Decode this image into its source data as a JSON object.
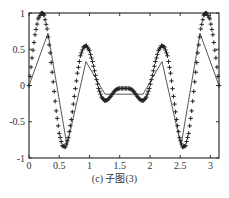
{
  "chart_data": {
    "type": "line",
    "title": "",
    "caption": "(c) 子图(3)",
    "xlabel": "",
    "ylabel": "",
    "xlim": [
      0,
      3.1416
    ],
    "ylim": [
      -1,
      1
    ],
    "xticks": [
      0,
      0.5,
      1,
      1.5,
      2,
      2.5,
      3
    ],
    "xtick_labels": [
      "0",
      "0.5",
      "1",
      "1.5",
      "2",
      "2.5",
      "3"
    ],
    "yticks": [
      -1,
      -0.5,
      0,
      0.5,
      1
    ],
    "ytick_labels": [
      "-1",
      "-0.5",
      "0",
      "0.5",
      "1"
    ],
    "grid": false,
    "legend": null,
    "series": [
      {
        "name": "dense samples (+ markers)",
        "style": "plus-markers",
        "color": "#222222",
        "function_hint": "symmetric about pi/2: max 1 at x~0.22, min ~-0.85 at x~0.6, max ~0.55 at x~0.95, min ~-0.2 at x~1.35, local max ~-0.05 at pi/2",
        "x": [
          0.0,
          0.05,
          0.1,
          0.15,
          0.2,
          0.22,
          0.25,
          0.3,
          0.35,
          0.4,
          0.45,
          0.5,
          0.55,
          0.6,
          0.65,
          0.7,
          0.75,
          0.8,
          0.85,
          0.9,
          0.95,
          1.0,
          1.05,
          1.1,
          1.15,
          1.2,
          1.25,
          1.3,
          1.35,
          1.4,
          1.45,
          1.5,
          1.5708,
          1.64,
          1.69,
          1.74,
          1.79,
          1.84,
          1.89,
          1.94,
          1.99,
          2.04,
          2.09,
          2.14,
          2.19,
          2.24,
          2.29,
          2.34,
          2.39,
          2.44,
          2.49,
          2.54,
          2.59,
          2.64,
          2.69,
          2.74,
          2.79,
          2.84,
          2.89,
          2.92,
          2.94,
          2.99,
          3.04,
          3.09,
          3.1416
        ],
        "y": [
          0.0,
          0.38,
          0.7,
          0.92,
          0.99,
          1.0,
          0.97,
          0.78,
          0.45,
          0.05,
          -0.35,
          -0.66,
          -0.83,
          -0.85,
          -0.72,
          -0.47,
          -0.15,
          0.17,
          0.41,
          0.53,
          0.55,
          0.48,
          0.33,
          0.14,
          -0.04,
          -0.16,
          -0.21,
          -0.2,
          -0.15,
          -0.09,
          -0.05,
          -0.04,
          -0.04,
          -0.04,
          -0.05,
          -0.09,
          -0.15,
          -0.2,
          -0.21,
          -0.16,
          -0.04,
          0.14,
          0.33,
          0.48,
          0.55,
          0.53,
          0.41,
          0.17,
          -0.15,
          -0.47,
          -0.72,
          -0.85,
          -0.83,
          -0.66,
          -0.35,
          0.05,
          0.45,
          0.78,
          0.97,
          1.0,
          0.99,
          0.92,
          0.7,
          0.38,
          0.0
        ]
      },
      {
        "name": "coarse approximation (solid line)",
        "style": "solid-line",
        "color": "#444444",
        "x": [
          0.0,
          0.314,
          0.628,
          0.942,
          1.257,
          1.571,
          1.885,
          2.199,
          2.513,
          2.827,
          3.1416
        ],
        "y": [
          0.0,
          0.72,
          -0.83,
          0.33,
          -0.12,
          -0.12,
          -0.12,
          0.33,
          -0.83,
          0.72,
          0.0
        ]
      }
    ]
  },
  "plot_area": {
    "left": 29,
    "top": 13,
    "right": 219,
    "bottom": 158
  }
}
